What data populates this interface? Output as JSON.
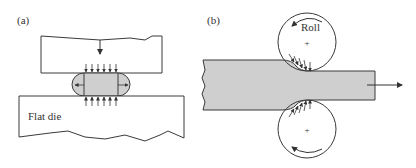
{
  "panels": {
    "a": {
      "label": "(a)",
      "die_label": "Flat die",
      "description": "Open-die forging between flat dies: upper die moves down, workpiece barrels, friction stresses act inward on top and bottom faces"
    },
    "b": {
      "label": "(b)",
      "roll_label": "Roll",
      "center_mark": "+",
      "description": "Flat rolling: strip passes between two rotating rolls and exits to the right"
    }
  },
  "colors": {
    "stroke": "#3a3a3a",
    "workpiece_fill": "#cfcfcf",
    "background": "#ffffff"
  }
}
